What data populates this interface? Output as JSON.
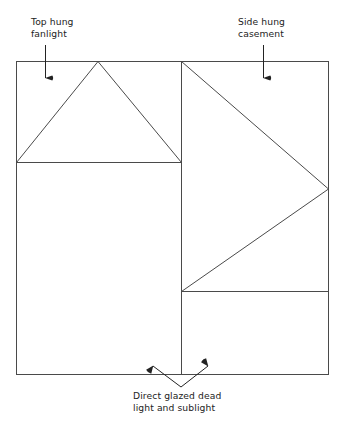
{
  "diagram": {
    "background_color": "#ffffff",
    "line_color": "#4a4a4a",
    "text_color": "#232323",
    "frame": {
      "name": "outer-window-frame",
      "x": 16,
      "y": 61,
      "width": 313,
      "height": 314,
      "right": 329,
      "bottom": 375
    },
    "mullion": {
      "name": "vertical-mullion",
      "x": 181,
      "y_top": 61,
      "y_bottom": 375
    },
    "left_transom": {
      "name": "left-transom",
      "y": 162,
      "x_start": 16,
      "x_end": 181
    },
    "right_transom": {
      "name": "right-transom",
      "y": 291,
      "x_start": 181,
      "x_end": 329
    },
    "top_hung_symbol": {
      "name": "top-hung-fanlight-symbol",
      "apex_x": 98,
      "apex_y": 61,
      "left_x": 16,
      "left_y": 162,
      "right_x": 181,
      "right_y": 162
    },
    "side_hung_symbol": {
      "name": "side-hung-casement-symbol",
      "apex_x": 329,
      "apex_y": 189,
      "top_x": 181,
      "top_y": 61,
      "bottom_x": 181,
      "bottom_y": 291
    }
  },
  "annotations": {
    "top_hung": {
      "label_line1": "Top hung",
      "label_line2": "fanlight",
      "leader": {
        "x": 45,
        "y_start": 45,
        "y_end": 78,
        "direction": "down"
      }
    },
    "side_hung": {
      "label_line1": "Side hung",
      "label_line2": "casement",
      "leader": {
        "x": 263,
        "y_start": 45,
        "y_end": 78,
        "direction": "down"
      }
    },
    "direct_glazed": {
      "label_line1": "Direct glazed dead",
      "label_line2": "light and sublight",
      "leader": {
        "vertex_x": 181,
        "vertex_y": 387,
        "left_tip_x": 153,
        "left_tip_y": 366,
        "right_tip_x": 208,
        "right_tip_y": 366,
        "direction": "up-split"
      }
    }
  }
}
